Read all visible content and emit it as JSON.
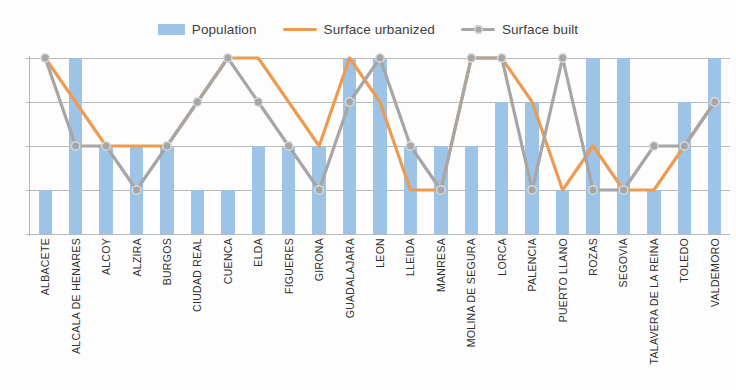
{
  "chart_data": {
    "type": "bar",
    "title": "",
    "subtitle": "",
    "xlabel": "",
    "ylabel": "",
    "ylim": [
      0,
      4
    ],
    "yticks": [
      "0",
      "1",
      "2",
      "3",
      "4"
    ],
    "grid": true,
    "legend_position": "top-center",
    "categories": [
      "ALBACETE",
      "ALCALA DE HENARES",
      "ALCOY",
      "ALZIRA",
      "BURGOS",
      "CIUDAD REAL",
      "CUENCA",
      "ELDA",
      "FIGUERES",
      "GIRONA",
      "GUADALAJARA",
      "LEON",
      "LLEIDA",
      "MANRESA",
      "MOLINA DE SEGURA",
      "LORCA",
      "PALENCIA",
      "PUERTO LLANO",
      "ROZAS",
      "SEGOVIA",
      "TALAVERA DE LA REINA",
      "TOLEDO",
      "VALDEMORO"
    ],
    "series": [
      {
        "name": "Population",
        "type": "bar",
        "color": "#9dc3e6",
        "values": [
          1,
          4,
          2,
          2,
          2,
          1,
          1,
          2,
          2,
          2,
          4,
          4,
          2,
          2,
          2,
          3,
          3,
          1,
          4,
          4,
          1,
          3,
          4
        ]
      },
      {
        "name": "Surface urbanized",
        "type": "line",
        "color": "#ed9b50",
        "values": [
          4,
          3,
          2,
          2,
          2,
          3,
          4,
          4,
          3,
          2,
          4,
          3,
          1,
          1,
          4,
          4,
          3,
          1,
          2,
          1,
          1,
          2,
          3
        ]
      },
      {
        "name": "Surface  built",
        "type": "line",
        "color": "#a6a6a6",
        "marker": "circle",
        "values": [
          4,
          2,
          2,
          1,
          2,
          3,
          4,
          3,
          2,
          1,
          3,
          4,
          2,
          1,
          4,
          4,
          1,
          4,
          1,
          1,
          2,
          2,
          3
        ]
      }
    ]
  },
  "legend": {
    "items": [
      {
        "label": "Population",
        "icon": "bar-swatch"
      },
      {
        "label": "Surface urbanized",
        "icon": "line-swatch"
      },
      {
        "label": "Surface  built",
        "icon": "line-marker-swatch"
      }
    ]
  }
}
